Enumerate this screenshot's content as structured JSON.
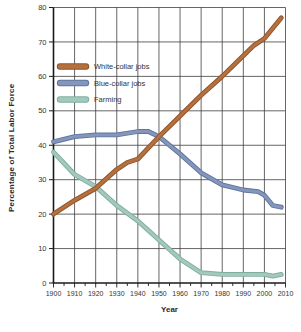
{
  "figure": {
    "background": "#ffffff",
    "grid_color": "#3f3f3f",
    "axis_color": "#1a1a1a",
    "label_color": "#333333"
  },
  "chart_data": {
    "type": "line",
    "title": "",
    "xlabel": "Year",
    "ylabel": "Percentage of Total Labor Force",
    "xlim": [
      1900,
      2010
    ],
    "ylim": [
      0,
      80
    ],
    "x_ticks": [
      1900,
      1910,
      1920,
      1930,
      1940,
      1950,
      1960,
      1970,
      1980,
      1990,
      2000,
      2010
    ],
    "x_minor_tick_step": 5,
    "y_ticks": [
      0,
      10,
      20,
      30,
      40,
      50,
      60,
      70,
      80
    ],
    "grid": true,
    "legend_position": "upper-left-inside",
    "series": [
      {
        "name": "Farming",
        "color": "#a3c9bf",
        "edge_color": "#7fae9f",
        "points": [
          [
            1900,
            38
          ],
          [
            1910,
            31.5
          ],
          [
            1920,
            28
          ],
          [
            1930,
            22.5
          ],
          [
            1940,
            18
          ],
          [
            1950,
            12.5
          ],
          [
            1960,
            7
          ],
          [
            1970,
            3
          ],
          [
            1980,
            2.5
          ],
          [
            1990,
            2.5
          ],
          [
            2000,
            2.5
          ],
          [
            2004,
            2
          ],
          [
            2008,
            2.5
          ]
        ]
      },
      {
        "name": "Blue-collar jobs",
        "color": "#8496ba",
        "edge_color": "#5f74a2",
        "points": [
          [
            1900,
            41
          ],
          [
            1910,
            42.5
          ],
          [
            1920,
            43
          ],
          [
            1930,
            43
          ],
          [
            1940,
            44
          ],
          [
            1945,
            44
          ],
          [
            1950,
            42.5
          ],
          [
            1960,
            37.5
          ],
          [
            1970,
            32
          ],
          [
            1980,
            28.5
          ],
          [
            1990,
            27
          ],
          [
            1997,
            26.5
          ],
          [
            2000,
            25.5
          ],
          [
            2004,
            22.5
          ],
          [
            2008,
            22
          ]
        ]
      },
      {
        "name": "White-collar jobs",
        "color": "#b4713f",
        "edge_color": "#8e5327",
        "points": [
          [
            1900,
            20
          ],
          [
            1910,
            24
          ],
          [
            1920,
            27.5
          ],
          [
            1930,
            33
          ],
          [
            1935,
            35
          ],
          [
            1940,
            36
          ],
          [
            1950,
            42.5
          ],
          [
            1960,
            48.5
          ],
          [
            1970,
            54.5
          ],
          [
            1980,
            60
          ],
          [
            1990,
            66
          ],
          [
            1995,
            69
          ],
          [
            2000,
            71
          ],
          [
            2008,
            77
          ]
        ]
      }
    ],
    "legend_order": [
      "White-collar jobs",
      "Blue-collar jobs",
      "Farming"
    ]
  }
}
